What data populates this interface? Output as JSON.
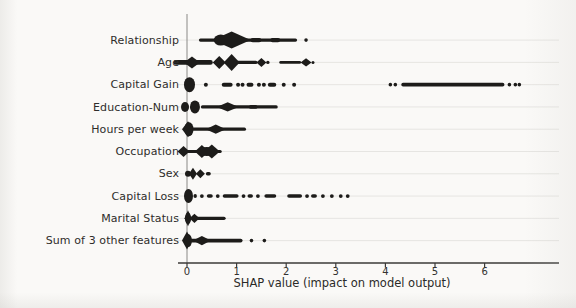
{
  "figure": {
    "background": "#faf9f7",
    "dot_color": "#1d1c1a",
    "label_color": "#2e2d2b",
    "axis_color": "#3b3a38",
    "spine_color": "#8a8986",
    "grid_color": "#e6e5e2"
  },
  "chart_data": {
    "type": "scatter",
    "variant": "shap-beeswarm-summary",
    "title": "",
    "xlabel": "SHAP value (impact on model output)",
    "ylabel": "",
    "legend": "none",
    "grid": "faint-horizontal-row-lines",
    "xticks": [
      "0",
      "1",
      "2",
      "3",
      "4",
      "5",
      "6"
    ],
    "xtick_values": [
      0,
      1,
      2,
      3,
      4,
      5,
      6
    ],
    "xlim": [
      -0.35,
      7.45
    ],
    "point_color": "monochrome-black",
    "features": [
      {
        "name": "Relationship",
        "shap_range": [
          0.22,
          2.4
        ],
        "peak_density_at": 0.9,
        "shapes": [
          [
            "line",
            0.24,
            2.22,
            3.2
          ],
          [
            "dash",
            1.28,
            1.5,
            4.4
          ],
          [
            "dash",
            1.68,
            1.88,
            4.2
          ],
          [
            "ellipse",
            0.68,
            7,
            5.5
          ],
          [
            "diamond",
            0.9,
            19,
            8.5
          ],
          [
            "dot",
            2.4,
            1.8
          ]
        ]
      },
      {
        "name": "Age",
        "shap_range": [
          -0.28,
          2.55
        ],
        "peak_density_at": 0.9,
        "shapes": [
          [
            "dash",
            -0.27,
            0.52,
            4.6
          ],
          [
            "diamond",
            0.1,
            8,
            6
          ],
          [
            "diamond",
            0.65,
            6.5,
            6.5
          ],
          [
            "diamond",
            0.9,
            8,
            8.5
          ],
          [
            "line",
            1.0,
            1.42,
            3.2
          ],
          [
            "diamond",
            1.5,
            5,
            4.5
          ],
          [
            "dot",
            1.63,
            1.7
          ],
          [
            "line",
            1.86,
            2.3,
            2.8
          ],
          [
            "diamond",
            2.4,
            5.5,
            4.2
          ],
          [
            "dot",
            2.54,
            1.5
          ]
        ]
      },
      {
        "name": "Capital Gain",
        "shap_range": [
          0.0,
          6.7
        ],
        "peak_density_at": 0.05,
        "shapes": [
          [
            "ellipse",
            0.05,
            5.5,
            7.5
          ],
          [
            "dot",
            0.38,
            2
          ],
          [
            "dash",
            0.7,
            0.92,
            4
          ],
          [
            "dot",
            1.03,
            2
          ],
          [
            "dot",
            1.12,
            2
          ],
          [
            "dash",
            1.2,
            1.34,
            4
          ],
          [
            "dot",
            1.45,
            2
          ],
          [
            "dot",
            1.55,
            2
          ],
          [
            "dash",
            1.63,
            1.8,
            4
          ],
          [
            "dot",
            1.95,
            2
          ],
          [
            "dot",
            2.16,
            2
          ],
          [
            "dot",
            4.1,
            1.8
          ],
          [
            "dot",
            4.2,
            1.8
          ],
          [
            "dash",
            4.32,
            6.4,
            3.6
          ],
          [
            "dot",
            6.5,
            1.8
          ],
          [
            "dot",
            6.62,
            1.8
          ],
          [
            "dot",
            6.7,
            1.8
          ]
        ]
      },
      {
        "name": "Education-Num",
        "shap_range": [
          -0.15,
          1.84
        ],
        "peak_density_at": 0.15,
        "shapes": [
          [
            "ellipse",
            -0.04,
            4,
            5
          ],
          [
            "ellipse",
            0.16,
            5,
            6.5
          ],
          [
            "line",
            0.28,
            1.83,
            3.2
          ],
          [
            "diamond",
            0.82,
            11,
            4.6
          ],
          [
            "dash",
            1.25,
            1.42,
            3.8
          ]
        ]
      },
      {
        "name": "Hours per week",
        "shap_range": [
          -0.1,
          1.2
        ],
        "peak_density_at": 0.02,
        "shapes": [
          [
            "diamond",
            0.02,
            6,
            8
          ],
          [
            "ellipse",
            0.04,
            4.5,
            7
          ],
          [
            "line",
            0.1,
            1.19,
            3.2
          ],
          [
            "diamond",
            0.58,
            10,
            4.6
          ]
        ]
      },
      {
        "name": "Occupation",
        "shap_range": [
          -0.2,
          0.75
        ],
        "peak_density_at": 0.45,
        "shapes": [
          [
            "diamond",
            -0.07,
            6,
            5.5
          ],
          [
            "line",
            -0.12,
            0.7,
            3
          ],
          [
            "diamond",
            0.3,
            7,
            6.5
          ],
          [
            "diamond",
            0.5,
            8,
            7
          ],
          [
            "ellipse",
            0.4,
            8,
            4.5
          ]
        ]
      },
      {
        "name": "Sex",
        "shap_range": [
          -0.05,
          0.48
        ],
        "peak_density_at": 0.12,
        "shapes": [
          [
            "ellipse",
            0.02,
            3,
            3
          ],
          [
            "diamond",
            0.12,
            4,
            6
          ],
          [
            "diamond",
            0.27,
            4.5,
            4.5
          ],
          [
            "dash",
            0.38,
            0.48,
            3.4
          ]
        ]
      },
      {
        "name": "Capital Loss",
        "shap_range": [
          0.0,
          3.25
        ],
        "peak_density_at": 0.03,
        "shapes": [
          [
            "ellipse",
            0.03,
            4.5,
            7
          ],
          [
            "dash",
            0.13,
            0.2,
            4
          ],
          [
            "dot",
            0.3,
            1.9
          ],
          [
            "dash",
            0.4,
            0.52,
            3.6
          ],
          [
            "dot",
            0.62,
            1.9
          ],
          [
            "dash",
            0.72,
            1.04,
            3.6
          ],
          [
            "dot",
            1.14,
            1.9
          ],
          [
            "dash",
            1.22,
            1.33,
            3.6
          ],
          [
            "dot",
            1.43,
            1.9
          ],
          [
            "dash",
            1.56,
            1.8,
            3.6
          ],
          [
            "dash",
            2.02,
            2.32,
            3.6
          ],
          [
            "dot",
            2.42,
            1.9
          ],
          [
            "dash",
            2.5,
            2.62,
            3.6
          ],
          [
            "dot",
            2.74,
            1.9
          ],
          [
            "dot",
            2.92,
            1.9
          ],
          [
            "dot",
            3.1,
            1.9
          ],
          [
            "dot",
            3.24,
            1.9
          ]
        ]
      },
      {
        "name": "Marital Status",
        "shap_range": [
          -0.05,
          0.78
        ],
        "peak_density_at": 0.02,
        "shapes": [
          [
            "diamond",
            0.02,
            3.5,
            8
          ],
          [
            "ellipse",
            0.02,
            3,
            6
          ],
          [
            "diamond",
            0.15,
            5,
            4.6
          ],
          [
            "line",
            0.1,
            0.78,
            3.4
          ]
        ]
      },
      {
        "name": "Sum of 3 other features",
        "shap_range": [
          -0.05,
          1.56
        ],
        "peak_density_at": 0.0,
        "shapes": [
          [
            "diamond",
            0.0,
            5,
            9
          ],
          [
            "ellipse",
            0.02,
            4,
            6.5
          ],
          [
            "line",
            0.06,
            1.12,
            3.8
          ],
          [
            "diamond",
            0.3,
            9,
            4.6
          ],
          [
            "dot",
            1.3,
            1.8
          ],
          [
            "dot",
            1.56,
            1.8
          ]
        ]
      }
    ]
  }
}
